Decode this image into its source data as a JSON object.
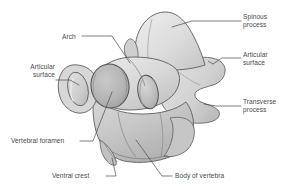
{
  "figure": {
    "view": "three-quarter cranial oblique",
    "background_color": "#ffffff",
    "label_text_color": "#4a4a4a",
    "leader_line_color": "#4a4a4a",
    "bone_fill_light": "#e8e8e8",
    "bone_fill_mid": "#d2d2d2",
    "bone_fill_shadow": "#bdbdbd",
    "bone_fill_dark": "#a8a8a8",
    "bone_outline": "#5a5a5a"
  },
  "labels": {
    "spinous_process": {
      "line1": "Spinous",
      "line2": "process"
    },
    "articular_surface_right": {
      "line1": "Articular",
      "line2": "surface"
    },
    "transverse_process": {
      "line1": "Transverse",
      "line2": "process"
    },
    "articular_surface_left": {
      "line1": "Articular",
      "line2": "surface"
    },
    "arch": {
      "line1": "Arch"
    },
    "vertebral_foramen": {
      "line1": "Vertebral foramen"
    },
    "ventral_crest": {
      "line1": "Ventral crest"
    },
    "body_of_vertebra": {
      "line1": "Body of vertebra"
    }
  }
}
